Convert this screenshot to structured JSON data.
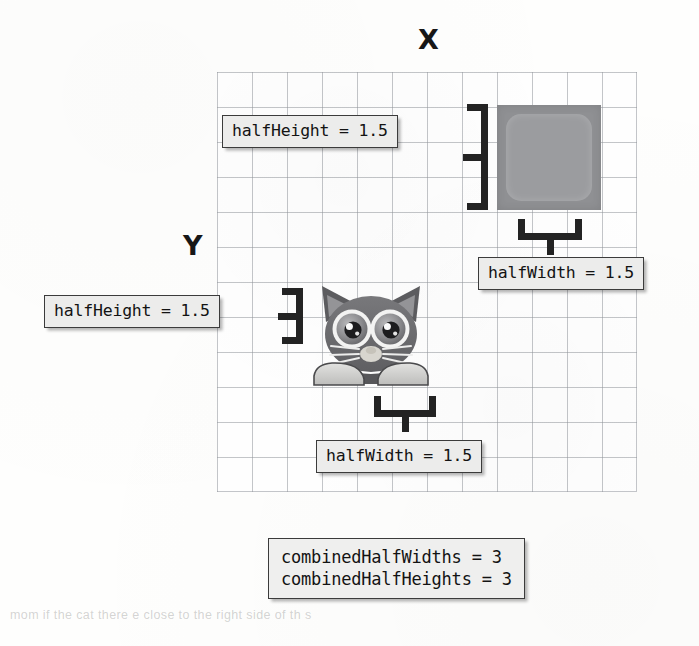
{
  "figure": {
    "axes": {
      "x_label": "X",
      "y_label": "Y"
    },
    "grid": {
      "columns": 12,
      "rows": 12,
      "cell_size_px": 35,
      "line_color": "#92969c"
    },
    "sprites": [
      {
        "name": "square",
        "shape": "rounded-square",
        "fill_color": "#8f9093",
        "half_width": 1.5,
        "half_height": 1.5
      },
      {
        "name": "cat",
        "shape": "cat-face",
        "fill_color": "#6e6e70",
        "half_width": 1.5,
        "half_height": 1.5
      }
    ]
  },
  "callouts": {
    "square_height": "halfHeight = 1.5",
    "square_width": "halfWidth = 1.5",
    "cat_height": "halfHeight = 1.5",
    "cat_width": "halfWidth = 1.5",
    "combined_widths": "combinedHalfWidths = 3",
    "combined_heights": "combinedHalfHeights = 3"
  },
  "background_bleed": {
    "bottom": "mom if the cat   there    e  close to the right side of th  s",
    "mid_1": "",
    "mid_2": "",
    "mid_3": "",
    "top": ""
  }
}
